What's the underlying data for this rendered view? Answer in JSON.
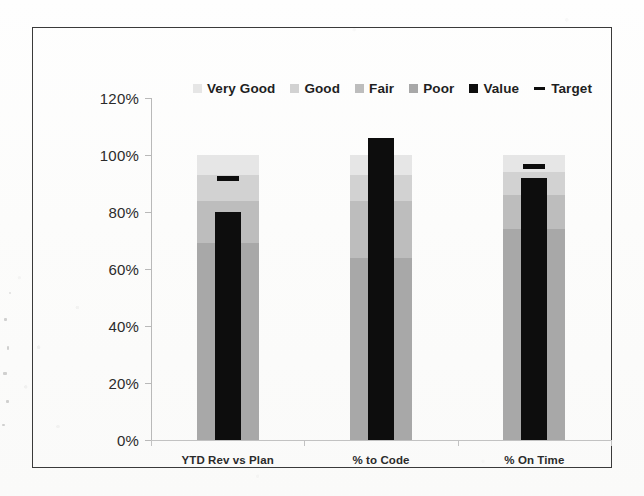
{
  "chart_data": {
    "type": "bar",
    "title": "",
    "subtitle": "",
    "xlabel": "",
    "ylabel": "",
    "categories": [
      "YTD Rev vs Plan",
      "% to Code",
      "% On Time"
    ],
    "ylim": [
      0,
      120
    ],
    "y_ticks": [
      "0%",
      "20%",
      "40%",
      "60%",
      "80%",
      "100%",
      "120%"
    ],
    "y_tick_values": [
      0,
      20,
      40,
      60,
      80,
      100,
      120
    ],
    "y_axis_unit": "%",
    "grid": false,
    "legend_position": "top-center",
    "legend": [
      "Very Good",
      "Good",
      "Fair",
      "Poor",
      "Value",
      "Target"
    ],
    "band_series": [
      {
        "name": "Poor",
        "color": "#a8a8a8",
        "values": [
          69,
          64,
          74
        ]
      },
      {
        "name": "Fair",
        "color": "#bdbdbd",
        "values": [
          15,
          20,
          12
        ]
      },
      {
        "name": "Good",
        "color": "#d2d2d2",
        "values": [
          9,
          9,
          8
        ]
      },
      {
        "name": "Very Good",
        "color": "#e6e6e6",
        "values": [
          7,
          7,
          6
        ]
      }
    ],
    "band_tops": [
      100,
      100,
      100
    ],
    "series": [
      {
        "name": "Value",
        "color": "#0d0d0d",
        "values": [
          80,
          106,
          92
        ]
      },
      {
        "name": "Target",
        "color": "#0d0d0d",
        "values": [
          92,
          99,
          96
        ],
        "marker": "dash"
      }
    ]
  },
  "legend": {
    "items": [
      {
        "label": "Very Good",
        "swatch": "#e6e6e6",
        "marker": "square"
      },
      {
        "label": "Good",
        "swatch": "#d2d2d2",
        "marker": "square"
      },
      {
        "label": "Fair",
        "swatch": "#bdbdbd",
        "marker": "square"
      },
      {
        "label": "Poor",
        "swatch": "#a8a8a8",
        "marker": "square"
      },
      {
        "label": "Value",
        "swatch": "#0d0d0d",
        "marker": "square"
      },
      {
        "label": "Target",
        "swatch": "#0d0d0d",
        "marker": "dash"
      }
    ]
  },
  "axis": {
    "y_labels": [
      "120%",
      "100%",
      "80%",
      "60%",
      "40%",
      "20%",
      "0%"
    ],
    "x_labels": [
      "YTD Rev vs Plan",
      "% to Code",
      "% On Time"
    ]
  },
  "colors": {
    "frame": "#3a3a3a",
    "axis": "#b9b9b9",
    "text": "#2b2b2b",
    "value": "#0d0d0d",
    "target": "#0d0d0d",
    "very_good": "#e6e6e6",
    "good": "#d2d2d2",
    "fair": "#bdbdbd",
    "poor": "#a8a8a8",
    "background": "#fdfdfc"
  }
}
